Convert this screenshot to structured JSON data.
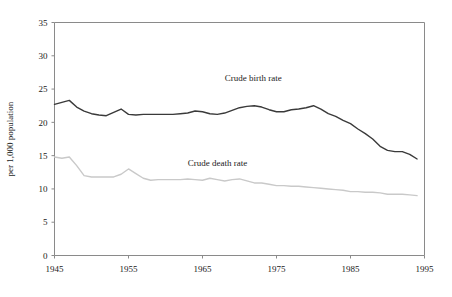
{
  "chart_data": {
    "type": "line",
    "title": "",
    "xlabel": "",
    "ylabel": "per 1,000 population",
    "xlim": [
      1945,
      1995
    ],
    "ylim": [
      0,
      35
    ],
    "xticks": [
      1945,
      1955,
      1965,
      1975,
      1985,
      1995
    ],
    "yticks": [
      0,
      5,
      10,
      15,
      20,
      25,
      30,
      35
    ],
    "grid": false,
    "legend_position": "inline-annotation",
    "x": [
      1945,
      1946,
      1947,
      1948,
      1949,
      1950,
      1951,
      1952,
      1953,
      1954,
      1955,
      1956,
      1957,
      1958,
      1959,
      1960,
      1961,
      1962,
      1963,
      1964,
      1965,
      1966,
      1967,
      1968,
      1969,
      1970,
      1971,
      1972,
      1973,
      1974,
      1975,
      1976,
      1977,
      1978,
      1979,
      1980,
      1981,
      1982,
      1983,
      1984,
      1985,
      1986,
      1987,
      1988,
      1989,
      1990,
      1991,
      1992,
      1993,
      1994
    ],
    "series": [
      {
        "name": "Crude birth rate",
        "color": "#3a3a3a",
        "width": 1.4,
        "label_x": 1968,
        "label_y": 26.2,
        "values": [
          22.7,
          23.0,
          23.3,
          22.3,
          21.7,
          21.3,
          21.1,
          21.0,
          21.5,
          22.0,
          21.2,
          21.1,
          21.2,
          21.2,
          21.2,
          21.2,
          21.2,
          21.3,
          21.4,
          21.7,
          21.6,
          21.3,
          21.2,
          21.4,
          21.8,
          22.2,
          22.4,
          22.5,
          22.3,
          21.9,
          21.6,
          21.6,
          21.9,
          22.0,
          22.2,
          22.5,
          22.0,
          21.3,
          20.9,
          20.3,
          19.8,
          19.0,
          18.3,
          17.5,
          16.4,
          15.8,
          15.6,
          15.6,
          15.2,
          14.5
        ]
      },
      {
        "name": "Crude death rate",
        "color": "#c9c9c9",
        "width": 1.4,
        "label_x": 1963,
        "label_y": 13.4,
        "values": [
          14.8,
          14.6,
          14.8,
          13.5,
          12.0,
          11.8,
          11.8,
          11.8,
          11.8,
          12.2,
          13.0,
          12.3,
          11.6,
          11.3,
          11.4,
          11.4,
          11.4,
          11.4,
          11.5,
          11.4,
          11.3,
          11.6,
          11.4,
          11.2,
          11.4,
          11.5,
          11.2,
          10.9,
          10.9,
          10.7,
          10.5,
          10.5,
          10.4,
          10.4,
          10.3,
          10.2,
          10.1,
          10.0,
          9.9,
          9.8,
          9.6,
          9.6,
          9.5,
          9.5,
          9.4,
          9.2,
          9.2,
          9.2,
          9.1,
          9.0
        ]
      }
    ]
  },
  "axes": {
    "y_tick_labels": [
      "0",
      "5",
      "10",
      "15",
      "20",
      "25",
      "30",
      "35"
    ],
    "x_tick_labels": [
      "1945",
      "1955",
      "1965",
      "1975",
      "1985",
      "1995"
    ],
    "y_axis_title": "per 1,000 population"
  },
  "annotations": [
    {
      "name": "birth-rate-label",
      "text": "Crude birth rate"
    },
    {
      "name": "death-rate-label",
      "text": "Crude death rate"
    }
  ]
}
